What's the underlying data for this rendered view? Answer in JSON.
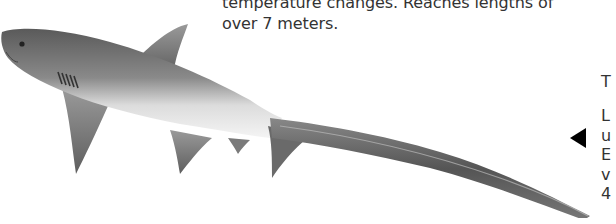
{
  "description": {
    "lines": [
      "temperature changes. Reaches lengths of",
      "over 7 meters."
    ]
  },
  "illustration": {
    "subject": "thresher shark",
    "style": "grayscale pencil drawing"
  },
  "navigation": {
    "arrow_icon": "left-triangle-icon",
    "arrow_color": "#000000"
  },
  "side_panel": {
    "title_fragment": "T",
    "body_fragments": [
      "L",
      "u",
      "E",
      "v",
      "4"
    ]
  }
}
